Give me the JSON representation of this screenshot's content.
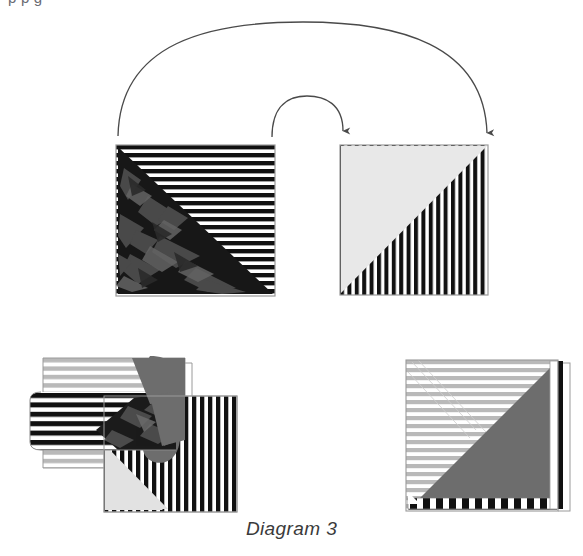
{
  "document": {
    "caption": "Diagram 3",
    "clipped_header_text": "p  p                                                                                          g"
  },
  "palette": {
    "background": "#ffffff",
    "ink_black": "#111111",
    "outline_gray": "#8a8a8a",
    "light_gray_fill": "#e8e8e8",
    "mid_gray_fill": "#6d6d6d",
    "stripe_gray": "#b9b9b9",
    "arrow_stroke": "#4a4a4a",
    "caption_color": "#3a3a3a"
  },
  "arrows": {
    "outer": {
      "name": "outer-flip-arrow",
      "from_x": 118,
      "from_y": 136,
      "to_x": 487,
      "to_y": 141,
      "apex_y": 31,
      "direction": "left-to-right"
    },
    "inner": {
      "name": "inner-flip-arrow",
      "from_x": 272,
      "from_y": 137,
      "to_x": 343,
      "to_y": 139,
      "apex_y": 101,
      "direction": "left-to-right"
    }
  },
  "figures": [
    {
      "id": "top-left-square",
      "name": "source-sheet-front",
      "x": 116,
      "y": 145,
      "width": 159,
      "height": 151,
      "base_pattern": "horizontal-stripes-black-white",
      "stripe_count": 19,
      "overlay": "lower-left-triangle-splinter-camouflage",
      "overlay_color": "#1b1b1b"
    },
    {
      "id": "top-right-square",
      "name": "target-sheet-front",
      "x": 340,
      "y": 145,
      "width": 148,
      "height": 150,
      "base_pattern": "vertical-stripes-black-white",
      "stripe_count": 20,
      "overlay": "upper-left-triangle-light-gray",
      "overlay_color": "#e8e8e8"
    },
    {
      "id": "bottom-left-figure",
      "name": "peeling-sheet-answer-a",
      "x": 30,
      "y": 352,
      "width": 205,
      "height": 160,
      "parts": [
        "back-sheet-light-gray-horizontal-stripes",
        "curled-flap-bold-black-horizontal-stripes",
        "curl-lobe-mid-gray",
        "base-vertical-stripes-with-light-gray-triangle",
        "splinter-camouflage-wedge"
      ]
    },
    {
      "id": "bottom-right-figure",
      "name": "folded-sheet-answer-b",
      "x": 406,
      "y": 357,
      "width": 165,
      "height": 155,
      "parts": [
        "upper-left-triangle-light-gray-horizontal-stripes",
        "lower-right-triangle-mid-gray-solid",
        "bottom-checkered-edge-strip",
        "right-edge-white-and-black-sliver"
      ]
    }
  ]
}
